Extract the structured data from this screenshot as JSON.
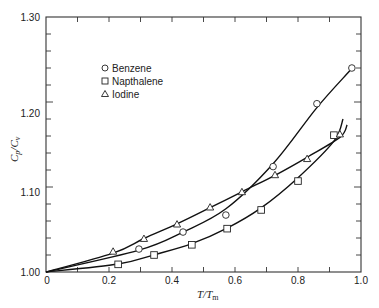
{
  "chart_data": {
    "type": "scatter",
    "title": "",
    "xlabel": "T/T_m",
    "ylabel": "C_p/C_v",
    "xlim": [
      0,
      1.0
    ],
    "ylim": [
      1.0,
      1.3
    ],
    "x_ticks": [
      "0",
      "0.2",
      "0.4",
      "0.6",
      "0.8",
      "1.0"
    ],
    "y_ticks": [
      "1.00",
      "1.10",
      "1.20",
      "1.30"
    ],
    "grid": false,
    "legend_position": "upper-left (inside)",
    "series": [
      {
        "name": "Benzene",
        "marker": "circle",
        "points": [
          [
            0.295,
            1.027
          ],
          [
            0.435,
            1.047
          ],
          [
            0.571,
            1.067
          ],
          [
            0.721,
            1.124
          ],
          [
            0.86,
            1.198
          ],
          [
            0.971,
            1.24
          ]
        ],
        "curve_end": [
          0.965,
          1.249
        ]
      },
      {
        "name": "Napthalene",
        "marker": "square",
        "points": [
          [
            0.229,
            1.009
          ],
          [
            0.343,
            1.02
          ],
          [
            0.463,
            1.032
          ],
          [
            0.575,
            1.051
          ],
          [
            0.683,
            1.073
          ],
          [
            0.8,
            1.107
          ],
          [
            0.914,
            1.161
          ]
        ],
        "curve_end": [
          0.943,
          1.18
        ]
      },
      {
        "name": "Iodine",
        "marker": "triangle",
        "points": [
          [
            0.213,
            1.024
          ],
          [
            0.311,
            1.039
          ],
          [
            0.416,
            1.056
          ],
          [
            0.521,
            1.076
          ],
          [
            0.622,
            1.094
          ],
          [
            0.727,
            1.114
          ],
          [
            0.829,
            1.133
          ],
          [
            0.933,
            1.162
          ]
        ],
        "curve_end": [
          0.956,
          1.173
        ]
      }
    ]
  },
  "labels": {
    "x_axis": "T/T",
    "x_axis_sub": "m",
    "y_axis_cp": "C",
    "y_axis_p": "p",
    "y_axis_cv": "/C",
    "y_axis_v": "v",
    "legend": [
      "Benzene",
      "Napthalene",
      "Iodine"
    ],
    "y_ticks": [
      "1.00",
      "1.10",
      "1.20",
      "1.30"
    ],
    "x_ticks": [
      "0",
      "0.2",
      "0.4",
      "0.6",
      "0.8",
      "1.0"
    ]
  }
}
